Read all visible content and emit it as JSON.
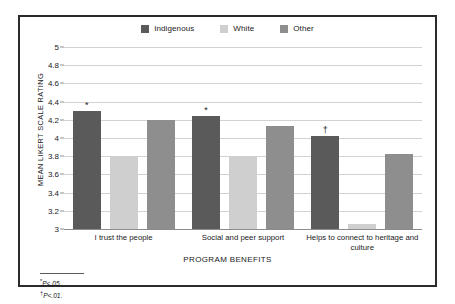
{
  "chart_data": {
    "type": "bar",
    "title": "",
    "xlabel": "PROGRAM BENEFITS",
    "ylabel": "MEAN LIKERT SCALE RATING",
    "ylim": [
      3,
      5
    ],
    "ytick_step": 0.2,
    "yticks": [
      "5",
      "4.8",
      "4.6",
      "4.4",
      "4.2",
      "4",
      "3.8",
      "3.6",
      "3.4",
      "3.2",
      "3"
    ],
    "grid": true,
    "legend_position": "top-center",
    "categories": [
      "I trust the people",
      "Social and peer support",
      "Helps to connect to heritage and culture"
    ],
    "series": [
      {
        "name": "Indigenous",
        "color": "#5a5a5a",
        "values": [
          4.3,
          4.24,
          4.02
        ]
      },
      {
        "name": "White",
        "color": "#cfcfcf",
        "values": [
          3.8,
          3.8,
          3.06
        ]
      },
      {
        "name": "Other",
        "color": "#8e8e8e",
        "values": [
          4.2,
          4.13,
          3.82
        ]
      }
    ],
    "annotations": [
      {
        "group": 0,
        "series": "Indigenous",
        "symbol": "*"
      },
      {
        "group": 1,
        "series": "Indigenous",
        "symbol": "*"
      },
      {
        "group": 2,
        "series": "Indigenous",
        "symbol": "†"
      }
    ]
  },
  "legend": {
    "items": [
      {
        "label": "Indigenous",
        "color": "#5a5a5a"
      },
      {
        "label": "White",
        "color": "#cfcfcf"
      },
      {
        "label": "Other",
        "color": "#8e8e8e"
      }
    ]
  },
  "footnotes": [
    {
      "symbol": "*",
      "text": "P<.05"
    },
    {
      "symbol": "†",
      "text": "P<.01."
    }
  ]
}
